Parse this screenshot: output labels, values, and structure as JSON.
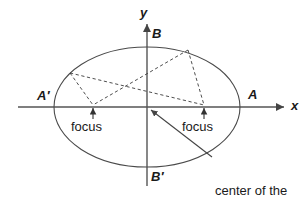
{
  "figure": {
    "background_color": "#ffffff",
    "stroke_color": "#444444",
    "text_color": "#1a1a1a"
  },
  "axes": {
    "x_label": "x",
    "y_label": "y",
    "origin": {
      "x": 147,
      "y": 107
    },
    "x_axis": {
      "start_x": 18,
      "end_x": 288,
      "y": 107
    },
    "y_axis": {
      "x": 147,
      "start_y": 186,
      "end_y": 21
    }
  },
  "ellipse": {
    "center": {
      "x": 147,
      "y": 107
    },
    "semi_major": 93,
    "semi_minor": 60
  },
  "vertex_labels": {
    "a_left": "A′",
    "a_right": "A",
    "b_top": "B",
    "b_bottom": "B′"
  },
  "foci": [
    {
      "name": "focus-left",
      "label": "focus",
      "x": 93,
      "y": 107
    },
    {
      "name": "focus-right",
      "label": "focus",
      "x": 204,
      "y": 107
    }
  ],
  "center_annotation": {
    "line1": "center of the",
    "line2": "ellipse",
    "leader_from": {
      "x": 212,
      "y": 157
    },
    "leader_to": {
      "x": 149,
      "y": 109
    }
  },
  "construction_points": [
    {
      "name": "point-upper-left",
      "x": 70,
      "y": 73
    },
    {
      "name": "point-upper-right",
      "x": 188,
      "y": 50
    }
  ],
  "dashed_segments": [
    {
      "name": "upper-left-to-focus-left",
      "x1": 70,
      "y1": 73,
      "x2": 93,
      "y2": 105
    },
    {
      "name": "upper-left-to-focus-right",
      "x1": 70,
      "y1": 73,
      "x2": 204,
      "y2": 105
    },
    {
      "name": "upper-right-to-focus-left",
      "x1": 188,
      "y1": 50,
      "x2": 93,
      "y2": 105
    },
    {
      "name": "upper-right-to-focus-right",
      "x1": 188,
      "y1": 50,
      "x2": 204,
      "y2": 105
    }
  ]
}
